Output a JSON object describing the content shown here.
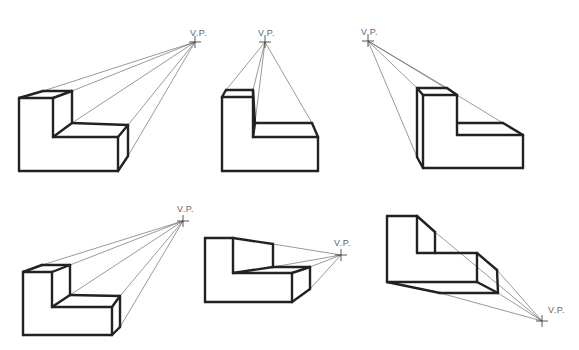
{
  "diagram": {
    "vp_label": "V.P.",
    "colors": {
      "object_lines": "#222222",
      "projection_lines": "#555555",
      "label": "#666666",
      "background": "#ffffff"
    },
    "figures": [
      {
        "id": "fig-1",
        "vp": [
          195,
          42
        ],
        "label_pos": [
          190,
          36
        ],
        "edges": [
          [
            19,
            98,
            19,
            171
          ],
          [
            19,
            171,
            118,
            171
          ],
          [
            118,
            171,
            118,
            137
          ],
          [
            118,
            137,
            53,
            137
          ],
          [
            53,
            137,
            53,
            98
          ],
          [
            53,
            98,
            19,
            98
          ],
          [
            19,
            98,
            43,
            91
          ],
          [
            43,
            91,
            72,
            91
          ],
          [
            72,
            91,
            53,
            98
          ],
          [
            72,
            91,
            72,
            123
          ],
          [
            72,
            123,
            53,
            137
          ],
          [
            72,
            123,
            128,
            125
          ],
          [
            128,
            125,
            118,
            137
          ],
          [
            128,
            125,
            128,
            156
          ],
          [
            128,
            156,
            118,
            171
          ]
        ],
        "rays": [
          [
            43,
            91
          ],
          [
            72,
            91
          ],
          [
            72,
            123
          ],
          [
            128,
            125
          ],
          [
            128,
            156
          ]
        ]
      },
      {
        "id": "fig-2",
        "vp": [
          265,
          42
        ],
        "label_pos": [
          258,
          36
        ],
        "edges": [
          [
            222,
            97,
            222,
            171
          ],
          [
            222,
            171,
            318,
            171
          ],
          [
            318,
            171,
            318,
            137
          ],
          [
            318,
            137,
            253,
            137
          ],
          [
            253,
            137,
            253,
            97
          ],
          [
            253,
            97,
            222,
            97
          ],
          [
            222,
            97,
            226,
            90
          ],
          [
            226,
            90,
            253,
            90
          ],
          [
            253,
            90,
            253,
            97
          ],
          [
            253,
            90,
            255,
            123
          ],
          [
            255,
            123,
            253,
            137
          ],
          [
            255,
            123,
            312,
            123
          ],
          [
            312,
            123,
            318,
            137
          ]
        ],
        "rays": [
          [
            226,
            90
          ],
          [
            253,
            90
          ],
          [
            255,
            123
          ],
          [
            312,
            123
          ]
        ]
      },
      {
        "id": "fig-3",
        "vp": [
          368,
          41
        ],
        "label_pos": [
          361,
          35
        ],
        "edges": [
          [
            423,
            95,
            423,
            168
          ],
          [
            423,
            168,
            523,
            168
          ],
          [
            523,
            168,
            523,
            135
          ],
          [
            523,
            135,
            457,
            135
          ],
          [
            457,
            135,
            457,
            95
          ],
          [
            457,
            95,
            423,
            95
          ],
          [
            423,
            95,
            417,
            88
          ],
          [
            417,
            88,
            447,
            88
          ],
          [
            447,
            88,
            457,
            95
          ],
          [
            417,
            88,
            417,
            157
          ],
          [
            417,
            157,
            423,
            168
          ],
          [
            457,
            123,
            503,
            123
          ],
          [
            503,
            123,
            523,
            135
          ]
        ],
        "rays": [
          [
            417,
            88
          ],
          [
            447,
            88
          ],
          [
            503,
            123
          ],
          [
            417,
            157
          ]
        ]
      },
      {
        "id": "fig-4",
        "vp": [
          183,
          221
        ],
        "label_pos": [
          177,
          212
        ],
        "edges": [
          [
            23,
            272,
            23,
            335
          ],
          [
            23,
            335,
            112,
            335
          ],
          [
            112,
            335,
            112,
            307
          ],
          [
            112,
            307,
            52,
            307
          ],
          [
            52,
            307,
            52,
            272
          ],
          [
            52,
            272,
            23,
            272
          ],
          [
            23,
            272,
            42,
            265
          ],
          [
            42,
            265,
            70,
            265
          ],
          [
            70,
            265,
            52,
            272
          ],
          [
            70,
            265,
            70,
            295
          ],
          [
            70,
            295,
            52,
            307
          ],
          [
            70,
            295,
            120,
            296
          ],
          [
            120,
            296,
            112,
            307
          ],
          [
            120,
            296,
            120,
            327
          ],
          [
            120,
            327,
            112,
            335
          ]
        ],
        "rays": [
          [
            42,
            265
          ],
          [
            70,
            265
          ],
          [
            70,
            295
          ],
          [
            120,
            296
          ],
          [
            120,
            327
          ]
        ]
      },
      {
        "id": "fig-5",
        "vp": [
          341,
          255
        ],
        "label_pos": [
          334,
          246
        ],
        "edges": [
          [
            205,
            238,
            205,
            302
          ],
          [
            205,
            302,
            292,
            302
          ],
          [
            292,
            302,
            292,
            273
          ],
          [
            292,
            273,
            233,
            273
          ],
          [
            233,
            273,
            233,
            238
          ],
          [
            233,
            238,
            205,
            238
          ],
          [
            233,
            238,
            273,
            244
          ],
          [
            273,
            244,
            273,
            267
          ],
          [
            273,
            267,
            233,
            273
          ],
          [
            273,
            267,
            310,
            267
          ],
          [
            310,
            267,
            292,
            273
          ],
          [
            310,
            267,
            310,
            289
          ],
          [
            310,
            289,
            292,
            302
          ]
        ],
        "rays": [
          [
            273,
            244
          ],
          [
            273,
            267
          ],
          [
            310,
            267
          ],
          [
            310,
            289
          ]
        ]
      },
      {
        "id": "fig-6",
        "vp": [
          542,
          321
        ],
        "label_pos": [
          548,
          313
        ],
        "edges": [
          [
            387,
            216,
            387,
            282
          ],
          [
            387,
            282,
            477,
            282
          ],
          [
            477,
            282,
            477,
            253
          ],
          [
            477,
            253,
            417,
            253
          ],
          [
            417,
            253,
            417,
            216
          ],
          [
            417,
            216,
            387,
            216
          ],
          [
            417,
            216,
            435,
            232
          ],
          [
            435,
            232,
            435,
            253
          ],
          [
            477,
            253,
            497,
            270
          ],
          [
            497,
            270,
            498,
            293
          ],
          [
            498,
            293,
            477,
            282
          ],
          [
            387,
            282,
            440,
            293
          ],
          [
            440,
            293,
            498,
            293
          ]
        ],
        "rays": [
          [
            435,
            232
          ],
          [
            497,
            270
          ],
          [
            498,
            293
          ],
          [
            440,
            293
          ]
        ]
      }
    ]
  }
}
